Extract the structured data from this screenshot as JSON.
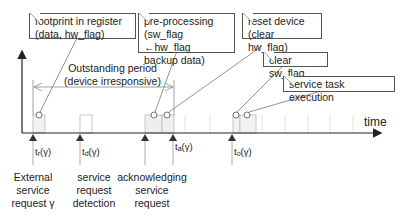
{
  "notes": {
    "footprint": {
      "line1": "footprint in register",
      "line2": "(data, hw_flag)"
    },
    "preprocessing": {
      "line1": "pre-processing",
      "line2": "(sw_flag ←hw_flag",
      "line3": "backup data)"
    },
    "reset": {
      "line1": "reset device",
      "line2": "(clear hw_flag)"
    },
    "clear_sw": {
      "line1": "clear sw_flag"
    },
    "service_task": {
      "line1": "service task execution"
    }
  },
  "outstanding": {
    "line1": "Outstanding period",
    "line2": "(device irresponsive)"
  },
  "axis": {
    "time_label": "time"
  },
  "ticks": [
    {
      "t": "t",
      "sub": "r",
      "arg": "(γ)"
    },
    {
      "t": "t",
      "sub": "d",
      "arg": "(γ)"
    },
    {
      "t": "t",
      "sub": "a",
      "arg": "(γ)"
    },
    {
      "t": "t",
      "sub": "o",
      "arg": "(γ)"
    }
  ],
  "events": {
    "external": {
      "line1": "External",
      "line2": "service",
      "line3": "request γ"
    },
    "detection": {
      "line1": "service",
      "line2": "request",
      "line3": "detection"
    },
    "acknowledging": {
      "line1": "acknowledging",
      "line2": "service",
      "line3": "request"
    }
  },
  "colors": {
    "line": "#333333",
    "grid": "#d8d8d8",
    "slot_fill": "#f0f0f0",
    "border": "#555555"
  }
}
